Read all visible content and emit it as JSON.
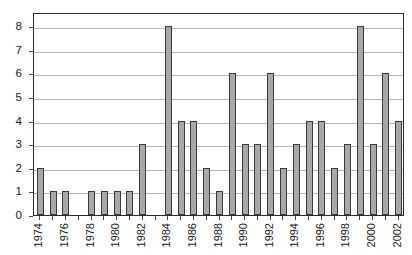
{
  "chart_data": {
    "type": "bar",
    "title": "",
    "subtitle": "",
    "xlabel": "",
    "ylabel": "",
    "categories": [
      "1974",
      "1975",
      "1976",
      "1977",
      "1978",
      "1979",
      "1980",
      "1981",
      "1982",
      "1983",
      "1984",
      "1985",
      "1986",
      "1987",
      "1988",
      "1989",
      "1990",
      "1991",
      "1992",
      "1993",
      "1994",
      "1995",
      "1996",
      "1997",
      "1998",
      "1999",
      "2000",
      "2001",
      "2002"
    ],
    "values": [
      2,
      1,
      1,
      0,
      1,
      1,
      1,
      1,
      3,
      0,
      8,
      4,
      4,
      2,
      1,
      6,
      3,
      3,
      6,
      2,
      3,
      4,
      4,
      2,
      3,
      8,
      3,
      6,
      4
    ],
    "series": [
      {
        "name": "count",
        "values": [
          2,
          1,
          1,
          0,
          1,
          1,
          1,
          1,
          3,
          0,
          8,
          4,
          4,
          2,
          1,
          6,
          3,
          3,
          6,
          2,
          3,
          4,
          4,
          2,
          3,
          8,
          3,
          6,
          4
        ]
      }
    ],
    "ylim": [
      0,
      8.6
    ],
    "ytick_labels": [
      "0",
      "1",
      "2",
      "3",
      "4",
      "5",
      "6",
      "7",
      "8"
    ],
    "ytick_values": [
      0,
      1,
      2,
      3,
      4,
      5,
      6,
      7,
      8
    ],
    "xtick_labels": [
      "1974",
      "1976",
      "1978",
      "1980",
      "1982",
      "1984",
      "1986",
      "1988",
      "1990",
      "1992",
      "1994",
      "1996",
      "1998",
      "2000",
      "2002"
    ],
    "xtick_label_rotation": 90,
    "grid": "horizontal",
    "legend": null,
    "legend_position": "none",
    "bar_fill_color": "#a8a8a8",
    "bar_edge_color": "#3a3a3a",
    "gridline_color": "#b8b8b8",
    "frame_color": "#2b2b2b",
    "background_color": "#ffffff"
  }
}
